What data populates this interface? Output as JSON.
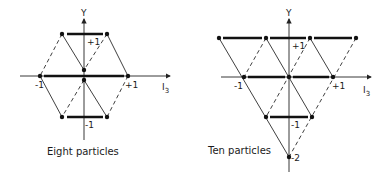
{
  "diagrams": [
    {
      "id": "octet",
      "caption": "Eight particles",
      "y_axis_label": "Y",
      "x_axis_label": "I",
      "x_axis_subscript": "3",
      "labels": {
        "y_plus": "+1",
        "y_minus": "-1",
        "i3_minus": "-1",
        "i3_plus": "+1"
      },
      "points": [
        {
          "I3": -0.5,
          "Y": 1
        },
        {
          "I3": 0.5,
          "Y": 1
        },
        {
          "I3": -1,
          "Y": 0
        },
        {
          "I3": 0,
          "Y": 0
        },
        {
          "I3": 0,
          "Y": 0
        },
        {
          "I3": 1,
          "Y": 0
        },
        {
          "I3": -0.5,
          "Y": -1
        },
        {
          "I3": 0.5,
          "Y": -1
        }
      ]
    },
    {
      "id": "decuplet",
      "caption": "Ten particles",
      "y_axis_label": "Y",
      "x_axis_label": "I",
      "x_axis_subscript": "3",
      "labels": {
        "y_plus": "+1",
        "y_minus": "-1",
        "y_minus2": "-2",
        "i3_minus": "-1",
        "i3_plus": "+1"
      },
      "points": [
        {
          "I3": -1.5,
          "Y": 1
        },
        {
          "I3": -0.5,
          "Y": 1
        },
        {
          "I3": 0.5,
          "Y": 1
        },
        {
          "I3": 1.5,
          "Y": 1
        },
        {
          "I3": -1,
          "Y": 0
        },
        {
          "I3": 0,
          "Y": 0
        },
        {
          "I3": 1,
          "Y": 0
        },
        {
          "I3": -0.5,
          "Y": -1
        },
        {
          "I3": 0.5,
          "Y": -1
        },
        {
          "I3": 0,
          "Y": -2
        }
      ]
    }
  ]
}
